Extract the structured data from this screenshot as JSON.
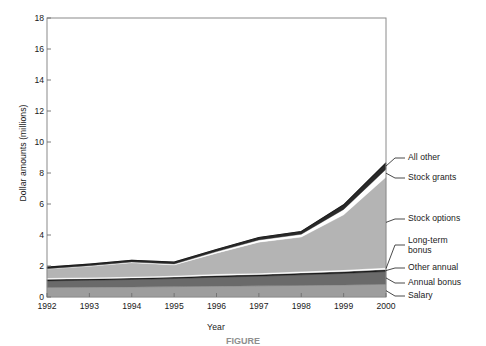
{
  "figure": {
    "caption": "FIGURE"
  },
  "chart_data": {
    "type": "area",
    "stacked": true,
    "title": "",
    "xlabel": "Year",
    "ylabel": "Dollar amounts (millions)",
    "x": [
      1992,
      1993,
      1994,
      1995,
      1996,
      1997,
      1998,
      1999,
      2000
    ],
    "xtick_labels": [
      "1992",
      "1993",
      "1994",
      "1995",
      "1996",
      "1997",
      "1998",
      "1999",
      "2000"
    ],
    "ytick_labels": [
      "0",
      "2",
      "4",
      "6",
      "8",
      "10",
      "12",
      "14",
      "16",
      "18"
    ],
    "ytick_values": [
      0,
      2,
      4,
      6,
      8,
      10,
      12,
      14,
      16,
      18
    ],
    "xlim": [
      1992,
      2000
    ],
    "ylim": [
      0,
      18
    ],
    "grid": false,
    "legend_position": "right-callouts",
    "series": [
      {
        "name": "Salary",
        "color": "#9d9d9d",
        "values": [
          0.62,
          0.63,
          0.65,
          0.67,
          0.7,
          0.72,
          0.75,
          0.78,
          0.82
        ]
      },
      {
        "name": "Annual bonus",
        "color": "#6a6a6a",
        "values": [
          0.42,
          0.45,
          0.48,
          0.52,
          0.58,
          0.62,
          0.68,
          0.74,
          0.82
        ]
      },
      {
        "name": "Other annual",
        "color": "#1c1c1c",
        "values": [
          0.1,
          0.1,
          0.1,
          0.1,
          0.11,
          0.11,
          0.12,
          0.12,
          0.13
        ]
      },
      {
        "name": "Long-term bonus",
        "color": "#ffffff",
        "values": [
          0.08,
          0.08,
          0.08,
          0.08,
          0.09,
          0.09,
          0.1,
          0.11,
          0.12
        ]
      },
      {
        "name": "Stock options",
        "color": "#b4b4b4",
        "values": [
          0.58,
          0.72,
          0.9,
          0.7,
          1.35,
          2.0,
          2.22,
          3.55,
          5.85
        ]
      },
      {
        "name": "Stock grants",
        "color": "#ffffff",
        "values": [
          0.03,
          0.04,
          0.05,
          0.06,
          0.1,
          0.14,
          0.18,
          0.35,
          0.5
        ]
      },
      {
        "name": "All other",
        "color": "#2a2a2a",
        "values": [
          0.1,
          0.1,
          0.11,
          0.12,
          0.14,
          0.16,
          0.18,
          0.3,
          0.42
        ]
      }
    ],
    "totals": [
      1.93,
      2.12,
      2.37,
      2.25,
      3.07,
      3.84,
      4.25,
      5.95,
      8.66
    ],
    "callouts": [
      {
        "label": "All other",
        "series": "All other"
      },
      {
        "label": "Stock grants",
        "series": "Stock grants"
      },
      {
        "label": "Stock options",
        "series": "Stock options"
      },
      {
        "label": "Long-term\nbonus",
        "series": "Long-term bonus"
      },
      {
        "label": "Other annual",
        "series": "Other annual"
      },
      {
        "label": "Annual bonus",
        "series": "Annual bonus"
      },
      {
        "label": "Salary",
        "series": "Salary"
      }
    ]
  }
}
